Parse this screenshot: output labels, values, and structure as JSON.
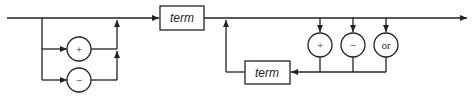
{
  "diagram": {
    "type": "syntax-diagram",
    "sign_options": [
      {
        "label": "+"
      },
      {
        "label": "−"
      }
    ],
    "first_term": {
      "label": "term"
    },
    "operators": [
      {
        "label": "+"
      },
      {
        "label": "−"
      },
      {
        "label": "or"
      }
    ],
    "loop_term": {
      "label": "term"
    },
    "colors": {
      "stroke": "#222222",
      "background": "#ffffff"
    }
  }
}
